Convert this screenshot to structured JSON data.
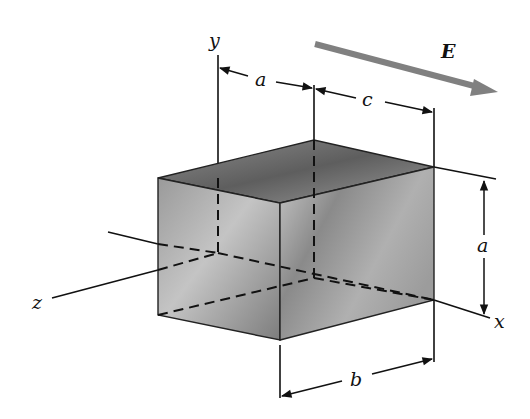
{
  "figure": {
    "labels": {
      "y_axis": "y",
      "x_axis": "x",
      "z_axis": "z",
      "field": "E",
      "dim_top_left": "a",
      "dim_top_right": "c",
      "dim_right_vertical": "a",
      "dim_bottom": "b"
    },
    "colors": {
      "line": "#111111",
      "field_arrow": "#7a7a7a",
      "box_fill_dark": "#6e6e6e",
      "box_fill_light": "#bdbdbd"
    }
  }
}
